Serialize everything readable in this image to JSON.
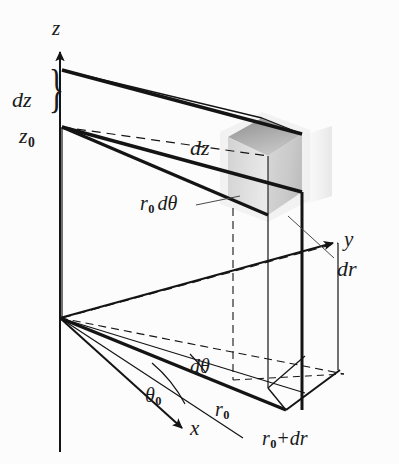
{
  "figure": {
    "background_color": "#fcfcfc",
    "line_color": "#141414",
    "shade_colors": {
      "top_face": "#8f8f8f",
      "left_face": "#d8d8d8",
      "right_face": "#c4c4c4",
      "front_face": "#ededed"
    }
  },
  "axes": {
    "z": "z",
    "y": "y",
    "x": "x"
  },
  "labels": {
    "dz_brace": "dz",
    "z0": "z",
    "z0_sub": "0",
    "dz_inner": "dz",
    "r0dtheta": "r",
    "r0dtheta_sub": "0",
    "r0dtheta_rest": "dθ",
    "dr": "dr",
    "dtheta": "dθ",
    "theta0": "θ",
    "theta0_sub": "0",
    "r0": "r",
    "r0_sub": "0",
    "r0plusdr": "r",
    "r0plusdr_sub": "0",
    "r0plusdr_op": "+",
    "r0plusdr_rest": "dr",
    "brace_glyph": "}"
  }
}
